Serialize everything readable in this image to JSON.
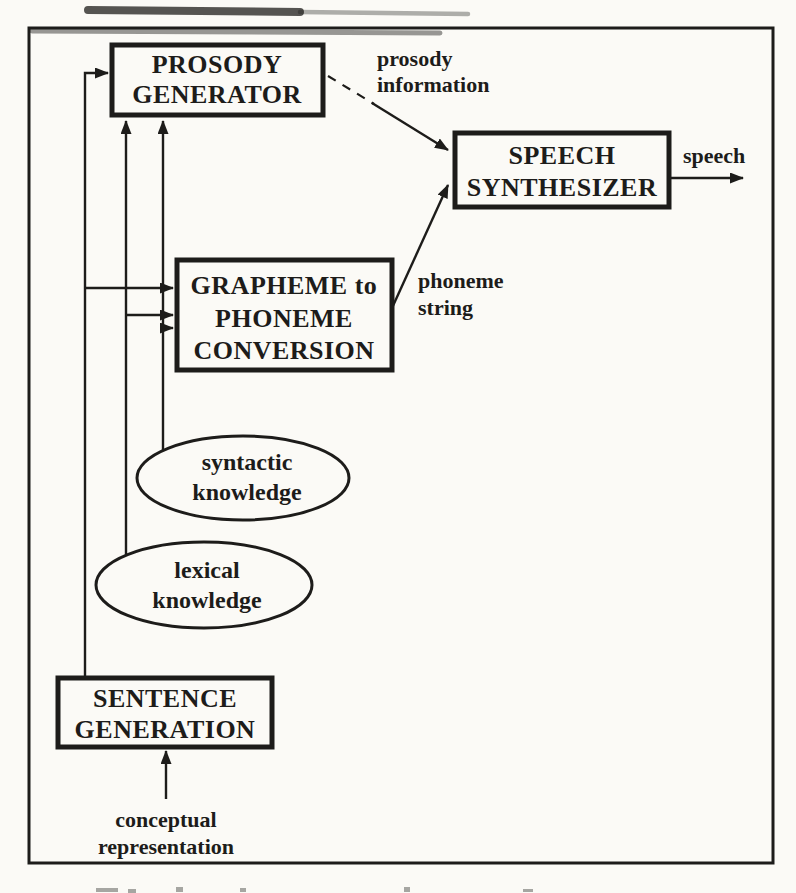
{
  "theme": {
    "paper": "#fbfaf6",
    "ink": "#1d1c1a"
  },
  "nodes": {
    "prosody_generator": {
      "lines": [
        "PROSODY",
        "GENERATOR"
      ]
    },
    "speech_synthesizer": {
      "lines": [
        "SPEECH",
        "SYNTHESIZER"
      ]
    },
    "grapheme_to_phoneme": {
      "lines": [
        "GRAPHEME to",
        "PHONEME",
        "CONVERSION"
      ]
    },
    "sentence_generation": {
      "lines": [
        "SENTENCE",
        "GENERATION"
      ]
    },
    "syntactic_knowledge": {
      "lines": [
        "syntactic",
        "knowledge"
      ]
    },
    "lexical_knowledge": {
      "lines": [
        "lexical",
        "knowledge"
      ]
    }
  },
  "edge_labels": {
    "prosody_information": {
      "lines": [
        "prosody",
        "information"
      ]
    },
    "phoneme_string": {
      "lines": [
        "phoneme",
        "string"
      ]
    },
    "speech": {
      "lines": [
        "speech"
      ]
    },
    "conceptual_representation": {
      "lines": [
        "conceptual",
        "representation"
      ]
    }
  }
}
